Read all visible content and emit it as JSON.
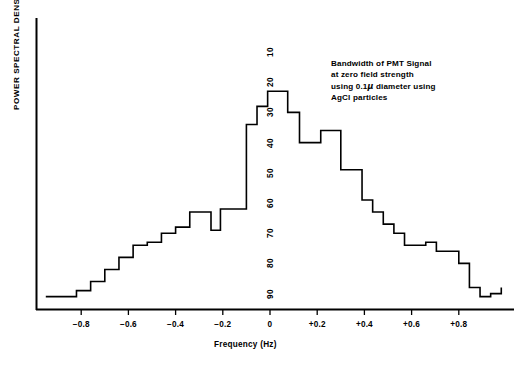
{
  "figure": {
    "y_axis_title": "POWER SPECTRAL DENSITY",
    "x_axis_title": "Frequency (Hz)",
    "annotation_lines": [
      "Bandwidth of PMT Signal",
      "at zero field strength",
      "using 0.1μ diameter using",
      "AgCl particles"
    ],
    "line_color": "#000000",
    "background_color": "#ffffff",
    "axis_color": "#000000"
  },
  "chart_data": {
    "type": "line",
    "subtype": "step-histogram",
    "title": "",
    "annotation": "Bandwidth of PMT Signal at zero field strength using 0.1μ diameter using AgCl particles",
    "xlabel": "Frequency (Hz)",
    "ylabel": "POWER SPECTRAL DENSITY",
    "xlim": [
      -0.95,
      1.0
    ],
    "ylim": [
      95,
      15
    ],
    "y_axis_inverted": true,
    "grid": false,
    "legend": false,
    "x_ticks": [
      -0.8,
      -0.6,
      -0.4,
      -0.2,
      0,
      0.2,
      0.4,
      0.6,
      0.8
    ],
    "x_tick_labels": [
      "−0.8",
      "−0.6",
      "−0.4",
      "−0.2",
      "0",
      "+0.2",
      "+0.4",
      "+0.6",
      "+0.8"
    ],
    "y_ticks": [
      10,
      20,
      30,
      40,
      50,
      60,
      70,
      80,
      90
    ],
    "y_tick_labels": [
      "10",
      "20",
      "30",
      "40",
      "50",
      "60",
      "70",
      "80",
      "90"
    ],
    "x_step_edges": [
      -0.95,
      -0.88,
      -0.82,
      -0.76,
      -0.7,
      -0.64,
      -0.58,
      -0.52,
      -0.46,
      -0.4,
      -0.34,
      -0.28,
      -0.25,
      -0.21,
      -0.145,
      -0.1,
      -0.055,
      -0.01,
      0.035,
      0.075,
      0.125,
      0.17,
      0.215,
      0.26,
      0.3,
      0.345,
      0.39,
      0.435,
      0.48,
      0.525,
      0.57,
      0.615,
      0.66,
      0.705,
      0.75,
      0.8,
      0.845,
      0.89,
      0.935,
      0.98
    ],
    "step_values": [
      91,
      91,
      89,
      86,
      82,
      78,
      74,
      73,
      70,
      68,
      63,
      63,
      69,
      62,
      62,
      34,
      28,
      23,
      23,
      30,
      40,
      40,
      36,
      36,
      49,
      49,
      59,
      63,
      67,
      70,
      74,
      74,
      73,
      76,
      76,
      80,
      88,
      91,
      90,
      88
    ]
  }
}
